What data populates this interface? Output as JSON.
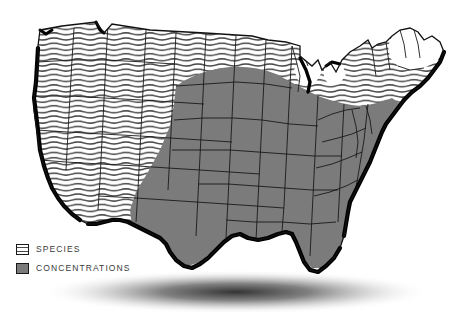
{
  "figure": {
    "type": "choropleth-map",
    "region": "United States",
    "background_color": "#ffffff",
    "shadow": "soft elliptical drop shadow beneath map"
  },
  "legend": {
    "items": [
      {
        "key": "species",
        "label": "SPECIES",
        "swatch_style": "wavy-horizontal-line-hatch",
        "swatch_fill": "#ffffff",
        "swatch_line_color": "#4a4a4a",
        "swatch_border": "#1a1a1a"
      },
      {
        "key": "concentrations",
        "label": "CONCENTRATIONS",
        "swatch_style": "solid",
        "swatch_fill": "#7b7b7b",
        "swatch_border": "#1a1a1a"
      }
    ]
  },
  "colors": {
    "concentrations_gray": "#7b7b7b",
    "hatch_line": "#4a4a4a",
    "state_border": "#1a1a1a",
    "coast_shadow": "#000000",
    "background": "#ffffff"
  },
  "map_regions": {
    "species_hatched": [
      "Washington",
      "Oregon",
      "California",
      "Idaho",
      "Nevada",
      "Utah",
      "Arizona",
      "Montana",
      "Wyoming",
      "Colorado",
      "New Mexico",
      "West Texas",
      "Western North Dakota",
      "Wisconsin",
      "Michigan",
      "Maine",
      "New Hampshire",
      "Vermont",
      "New York",
      "Massachusetts",
      "Connecticut",
      "Rhode Island",
      "Florida"
    ],
    "concentrations_gray": [
      "North Dakota",
      "South Dakota",
      "Nebraska",
      "Kansas",
      "Oklahoma",
      "East Texas",
      "Minnesota",
      "Iowa",
      "Missouri",
      "Arkansas",
      "Louisiana",
      "Illinois",
      "Indiana",
      "Ohio",
      "Kentucky",
      "Tennessee",
      "Mississippi",
      "Alabama",
      "Georgia",
      "South Carolina",
      "North Carolina",
      "Virginia",
      "West Virginia",
      "Pennsylvania",
      "Maryland",
      "Delaware",
      "New Jersey"
    ]
  }
}
